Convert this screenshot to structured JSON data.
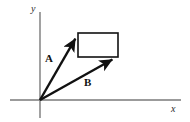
{
  "figure": {
    "type": "vector-diagram",
    "background_color": "#ffffff",
    "width": 190,
    "height": 122,
    "axes": {
      "x_axis_label": "x",
      "y_axis_label": "y",
      "axis_color": "#7a7a7a",
      "axis_stroke_width": 1.4,
      "origin": {
        "x": 40,
        "y": 100
      },
      "x_axis": {
        "x1": 10,
        "y1": 100,
        "x2": 181,
        "y2": 100
      },
      "y_axis": {
        "x1": 40,
        "y1": 12,
        "x2": 40,
        "y2": 118
      },
      "x_label_pos": {
        "x": 171,
        "y": 112
      },
      "y_label_pos": {
        "x": 31,
        "y": 12
      }
    },
    "vectors": [
      {
        "name": "A",
        "label": "A",
        "color": "#111111",
        "stroke_width": 2.4,
        "start": {
          "x": 40,
          "y": 100
        },
        "end": {
          "x": 78,
          "y": 34
        },
        "label_pos": {
          "x": 45,
          "y": 62
        }
      },
      {
        "name": "B",
        "label": "B",
        "color": "#111111",
        "stroke_width": 2.4,
        "start": {
          "x": 40,
          "y": 100
        },
        "end": {
          "x": 117,
          "y": 57
        },
        "label_pos": {
          "x": 84,
          "y": 86
        }
      }
    ],
    "rectangle": {
      "name": "reference-rectangle",
      "color": "#111111",
      "stroke_width": 1.6,
      "x": 78,
      "y": 33,
      "width": 40,
      "height": 24
    }
  }
}
